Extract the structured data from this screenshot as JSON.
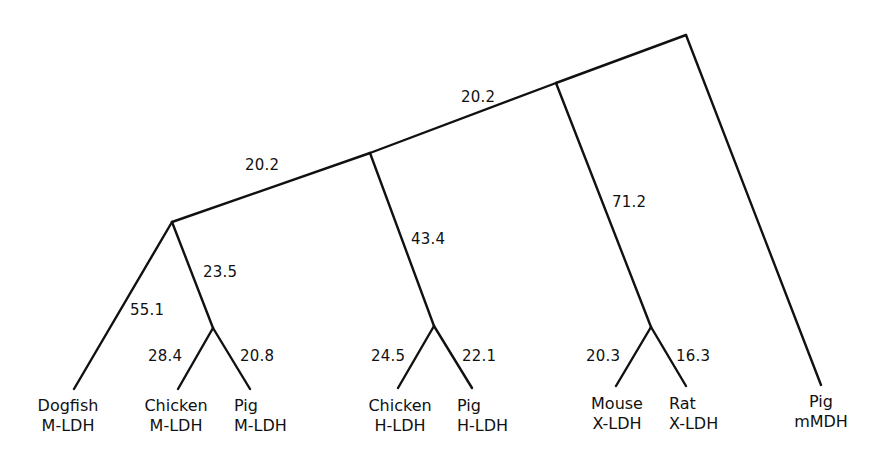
{
  "diagram": {
    "type": "phylogenetic-tree",
    "stroke_color": "#111111",
    "background": "#ffffff",
    "nodes": {
      "root": [
        686,
        35
      ],
      "C": [
        556,
        83
      ],
      "B": [
        370,
        153
      ],
      "A": [
        172,
        222
      ],
      "D": [
        213,
        328
      ],
      "E": [
        434,
        326
      ],
      "F": [
        651,
        327
      ]
    },
    "leaves": [
      {
        "id": "dogfish-mldh",
        "species": "Dogfish",
        "enzyme": "M-LDH",
        "end": [
          74,
          389
        ],
        "label_x": 68,
        "parent": "A"
      },
      {
        "id": "chicken-mldh",
        "species": "Chicken",
        "enzyme": "M-LDH",
        "end": [
          178,
          389
        ],
        "label_x": 176,
        "parent": "D"
      },
      {
        "id": "pig-mldh",
        "species": "Pig",
        "enzyme": "M-LDH",
        "end": [
          250,
          389
        ],
        "label_x": 267,
        "parent": "D"
      },
      {
        "id": "chicken-hldh",
        "species": "Chicken",
        "enzyme": "H-LDH",
        "end": [
          398,
          388
        ],
        "label_x": 400,
        "parent": "E"
      },
      {
        "id": "pig-hldh",
        "species": "Pig",
        "enzyme": "H-LDH",
        "end": [
          472,
          388
        ],
        "label_x": 484,
        "parent": "E"
      },
      {
        "id": "mouse-xldh",
        "species": "Mouse",
        "enzyme": "X-LDH",
        "end": [
          616,
          386
        ],
        "label_x": 617,
        "parent": "F"
      },
      {
        "id": "rat-xldh",
        "species": "Rat",
        "enzyme": "X-LDH",
        "end": [
          686,
          386
        ],
        "label_x": 701,
        "parent": "F"
      },
      {
        "id": "pig-mmdh",
        "species": "Pig",
        "enzyme": "mMDH",
        "end": [
          821,
          385
        ],
        "label_x": 821,
        "parent": "root"
      }
    ],
    "branch_lengths": [
      {
        "id": "root-to-C-upper",
        "value": "20.2",
        "pos": [
          474,
          90
        ]
      },
      {
        "id": "B-to-A",
        "value": "20.2",
        "pos": [
          245,
          158
        ]
      },
      {
        "id": "A-to-D",
        "value": "23.5",
        "pos": [
          203,
          265
        ]
      },
      {
        "id": "A-to-dogfish",
        "value": "55.1",
        "pos": [
          130,
          303
        ]
      },
      {
        "id": "D-to-chicken-mldh",
        "value": "28.4",
        "pos": [
          148,
          349
        ]
      },
      {
        "id": "D-to-pig-mldh",
        "value": "20.8",
        "pos": [
          240,
          349
        ]
      },
      {
        "id": "B-to-E",
        "value": "43.4",
        "pos": [
          411,
          232
        ]
      },
      {
        "id": "E-to-chicken-hldh",
        "value": "24.5",
        "pos": [
          371,
          349
        ]
      },
      {
        "id": "E-to-pig-hldh",
        "value": "22.1",
        "pos": [
          462,
          349
        ]
      },
      {
        "id": "C-to-F",
        "value": "71.2",
        "pos": [
          612,
          195
        ]
      },
      {
        "id": "F-to-mouse",
        "value": "20.3",
        "pos": [
          586,
          349
        ]
      },
      {
        "id": "F-to-rat",
        "value": "16.3",
        "pos": [
          676,
          349
        ]
      }
    ]
  }
}
